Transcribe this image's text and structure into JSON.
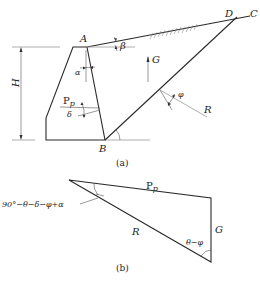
{
  "figure_a": {
    "caption": "(a)",
    "points": {
      "A": "A",
      "B": "B",
      "C": "C",
      "D": "D"
    },
    "dimension": {
      "height": "H"
    },
    "angles": {
      "alpha": "α",
      "beta": "β",
      "delta": "δ",
      "phi": "φ",
      "theta": "θ"
    },
    "forces": {
      "passive_earth_pressure": "P",
      "passive_subscript": "p",
      "weight": "G",
      "reaction": "R"
    }
  },
  "figure_b": {
    "caption": "(b)",
    "sides": {
      "passive_earth_pressure": "P",
      "passive_subscript": "p",
      "reaction": "R",
      "weight": "G"
    },
    "angle_top": "90°−θ−δ−φ+α",
    "angle_bottom": "θ−φ"
  }
}
